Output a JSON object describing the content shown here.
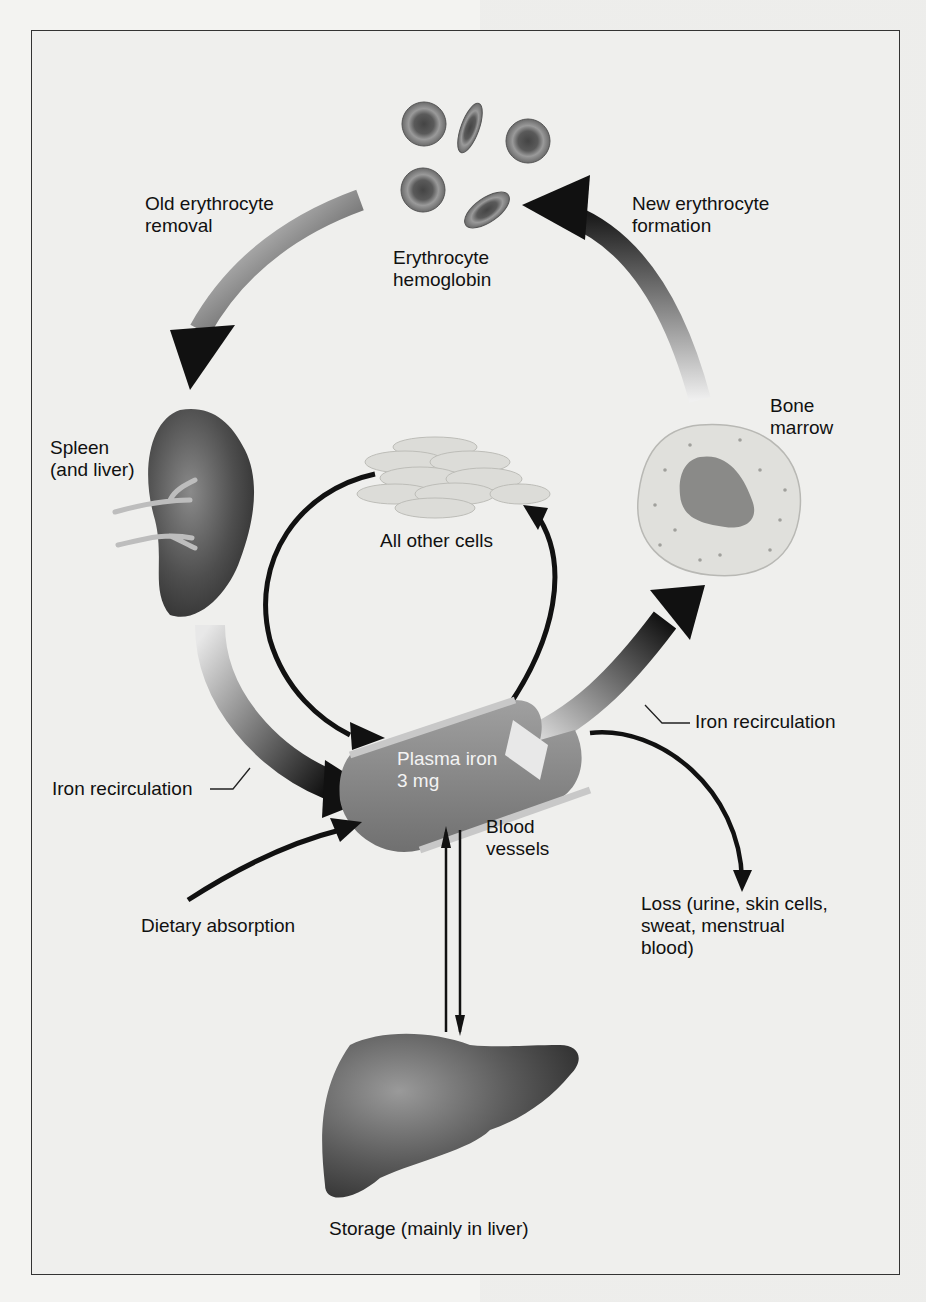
{
  "figure": {
    "labels": {
      "old_erythrocyte_removal": "Old erythrocyte\nremoval",
      "erythrocyte_hemoglobin": "Erythrocyte\nhemoglobin",
      "new_erythrocyte_formation": "New erythrocyte\nformation",
      "bone_marrow": "Bone\nmarrow",
      "spleen_and_liver": "Spleen\n(and liver)",
      "all_other_cells": "All other cells",
      "iron_recirculation_right": "Iron recirculation",
      "iron_recirculation_left": "Iron recirculation",
      "plasma_iron": "Plasma iron\n3 mg",
      "blood_vessels": "Blood\nvessels",
      "dietary_absorption": "Dietary absorption",
      "loss": "Loss (urine, skin cells,\nsweat, menstrual\nblood)",
      "storage": "Storage (mainly in liver)"
    },
    "icons": [
      "erythrocytes-icon",
      "spleen-icon",
      "tissue-cells-icon",
      "bone-marrow-cell-icon",
      "blood-vessel-icon",
      "liver-icon"
    ],
    "colors": {
      "frame": "#333333",
      "background": "#efefed",
      "arrow_dark": "#111111",
      "organ_dark": "#4a4a4a",
      "vessel": "#8a8a8a",
      "cell_light": "#d8d8d4"
    }
  }
}
